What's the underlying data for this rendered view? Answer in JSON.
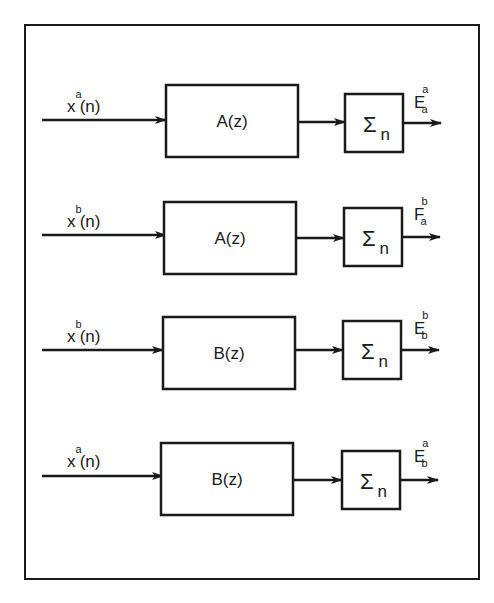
{
  "diagram": {
    "type": "block-diagram",
    "colors": {
      "stroke": "#1a1a1a",
      "background": "#ffffff"
    },
    "rows": [
      {
        "input": {
          "base": "x",
          "sup": "a",
          "arg": "(n)"
        },
        "filter": "A(z)",
        "sum": {
          "symbol": "Σ",
          "sub": "n"
        },
        "output": {
          "base": "E",
          "sup": "a",
          "sub": "a"
        }
      },
      {
        "input": {
          "base": "x",
          "sup": "b",
          "arg": "(n)"
        },
        "filter": "A(z)",
        "sum": {
          "symbol": "Σ",
          "sub": "n"
        },
        "output": {
          "base": "F",
          "sup": "b",
          "sub": "a"
        }
      },
      {
        "input": {
          "base": "x",
          "sup": "b",
          "arg": "(n)"
        },
        "filter": "B(z)",
        "sum": {
          "symbol": "Σ",
          "sub": "n"
        },
        "output": {
          "base": "E",
          "sup": "b",
          "sub": "b"
        }
      },
      {
        "input": {
          "base": "x",
          "sup": "a",
          "arg": "(n)"
        },
        "filter": "B(z)",
        "sum": {
          "symbol": "Σ",
          "sub": "n"
        },
        "output": {
          "base": "E",
          "sup": "a",
          "sub": "b"
        }
      }
    ]
  }
}
